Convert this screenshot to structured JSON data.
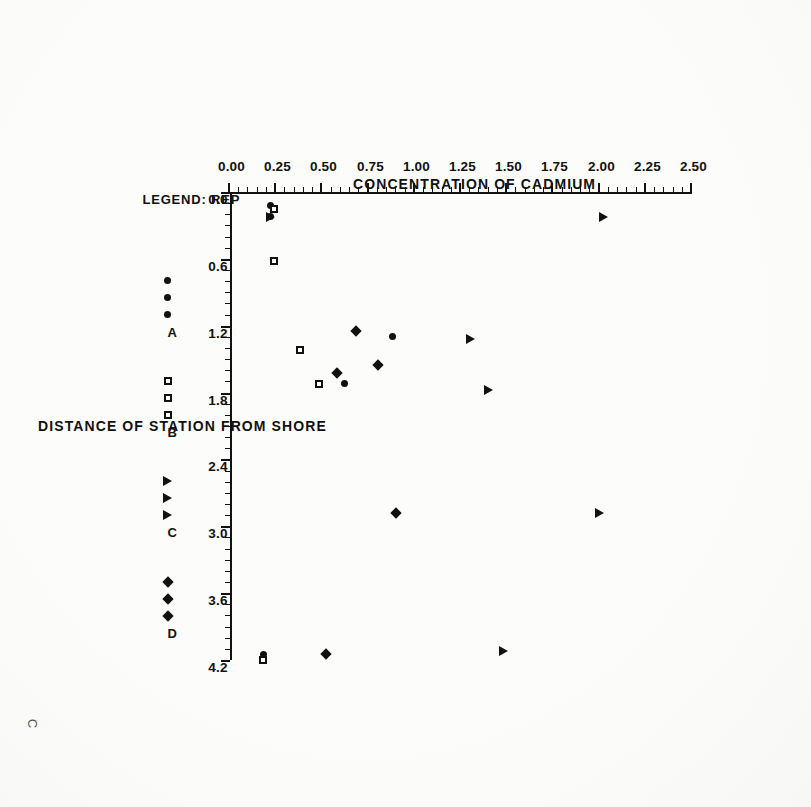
{
  "page_mark": "C",
  "chart_data": {
    "type": "scatter",
    "title": "",
    "xlabel": "DISTANCE OF STATION FROM SHORE",
    "ylabel": "CONCENTRATION OF CADMIUM",
    "xlim": [
      0.0,
      4.2
    ],
    "ylim": [
      0.0,
      2.5
    ],
    "xticks": [
      "0.0",
      "0.6",
      "1.2",
      "1.8",
      "2.4",
      "3.0",
      "3.6",
      "4.2"
    ],
    "xtick_values": [
      0.0,
      0.6,
      1.2,
      1.8,
      2.4,
      3.0,
      3.6,
      4.2
    ],
    "yticks": [
      "0.00",
      "0.25",
      "0.50",
      "0.75",
      "1.00",
      "1.25",
      "1.50",
      "1.75",
      "2.00",
      "2.25",
      "2.50"
    ],
    "ytick_values": [
      0.0,
      0.25,
      0.5,
      0.75,
      1.0,
      1.25,
      1.5,
      1.75,
      2.0,
      2.25,
      2.5
    ],
    "grid": false,
    "rotation_deg": 90,
    "legend": {
      "position": "below-axis",
      "prefix": "LEGEND:",
      "group_label": "REP",
      "entries": [
        {
          "label": "A",
          "marker": "circle",
          "glyph": "•••"
        },
        {
          "label": "B",
          "marker": "square",
          "glyph": "□□□"
        },
        {
          "label": "C",
          "marker": "triangle",
          "glyph": "▲▲▲"
        },
        {
          "label": "D",
          "marker": "diamond",
          "glyph": "♦♦♦"
        }
      ]
    },
    "series": [
      {
        "name": "A",
        "marker": "circle",
        "points": [
          {
            "x": 0.12,
            "y": 0.22
          },
          {
            "x": 0.22,
            "y": 0.22
          },
          {
            "x": 1.3,
            "y": 0.88
          },
          {
            "x": 1.72,
            "y": 0.62
          },
          {
            "x": 4.15,
            "y": 0.18
          }
        ]
      },
      {
        "name": "B",
        "marker": "square",
        "points": [
          {
            "x": 0.15,
            "y": 0.24
          },
          {
            "x": 0.62,
            "y": 0.24
          },
          {
            "x": 1.42,
            "y": 0.38
          },
          {
            "x": 1.72,
            "y": 0.48
          },
          {
            "x": 4.2,
            "y": 0.18
          }
        ]
      },
      {
        "name": "C",
        "marker": "triangle",
        "points": [
          {
            "x": 0.22,
            "y": 0.22
          },
          {
            "x": 0.22,
            "y": 2.02
          },
          {
            "x": 1.32,
            "y": 1.3
          },
          {
            "x": 1.78,
            "y": 1.4
          },
          {
            "x": 2.88,
            "y": 2.0
          },
          {
            "x": 4.12,
            "y": 1.48
          }
        ]
      },
      {
        "name": "D",
        "marker": "diamond",
        "points": [
          {
            "x": 1.25,
            "y": 0.68
          },
          {
            "x": 1.55,
            "y": 0.8
          },
          {
            "x": 1.62,
            "y": 0.58
          },
          {
            "x": 2.88,
            "y": 0.9
          },
          {
            "x": 4.15,
            "y": 0.52
          }
        ]
      }
    ]
  }
}
